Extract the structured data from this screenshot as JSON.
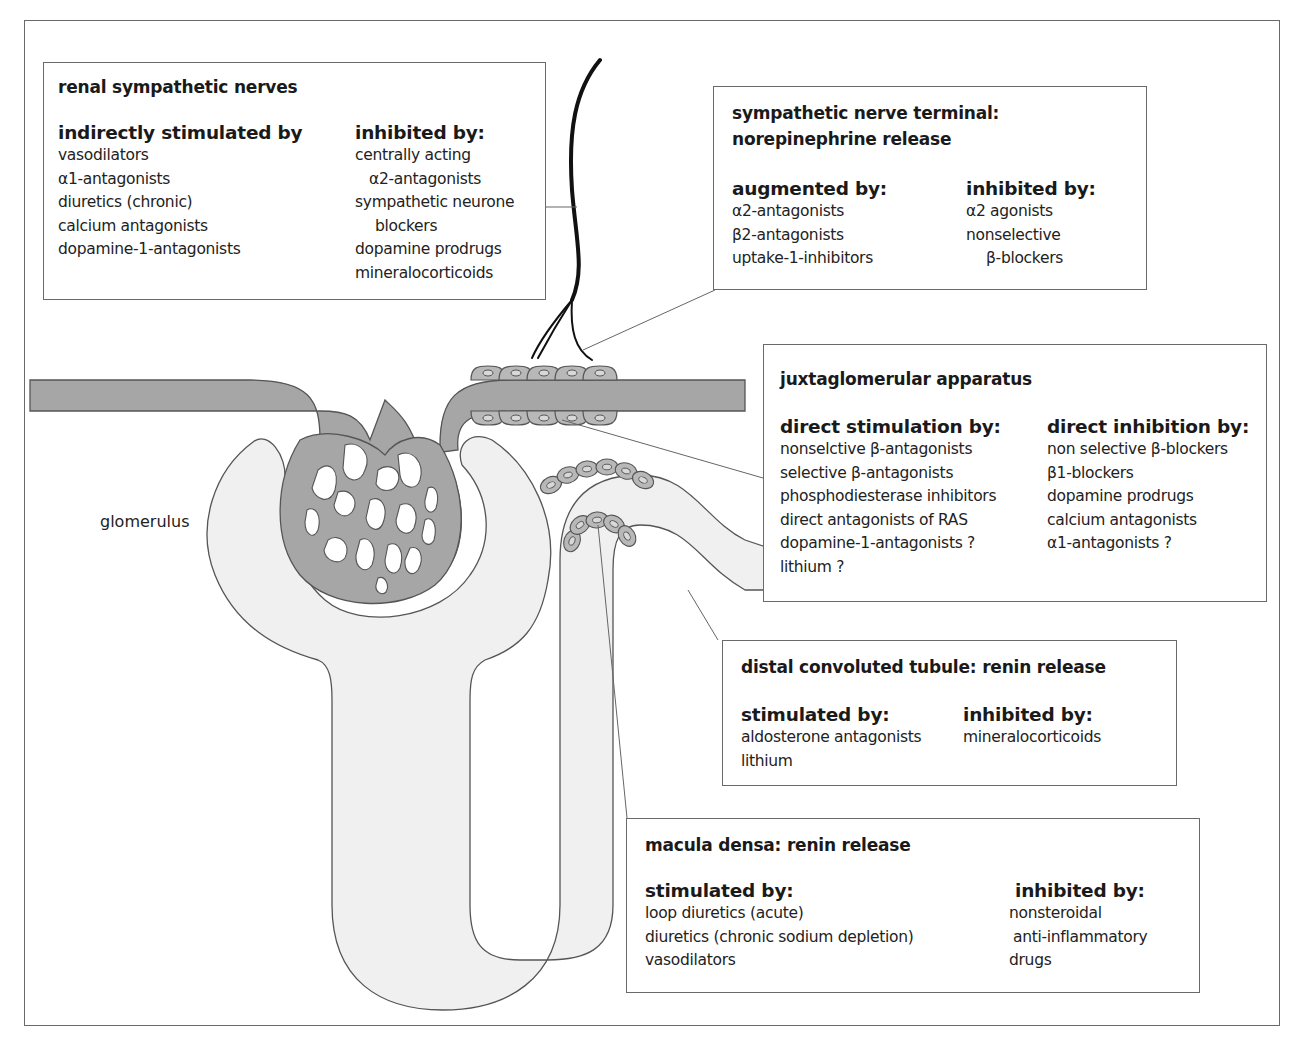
{
  "colors": {
    "vessel": "#a6a6a6",
    "tubule": "#f0f0f0",
    "outline": "#555555",
    "nerve": "#111111"
  },
  "labels": {
    "glomerulus": "glomerulus"
  },
  "boxes": {
    "renal_nerves": {
      "title": "renal sympathetic nerves",
      "left": {
        "heading": "indirectly stimulated by",
        "items": [
          "vasodilators",
          "α1-antagonists",
          "diuretics (chronic)",
          "calcium antagonists",
          "dopamine-1-antagonists"
        ]
      },
      "right": {
        "heading": "inhibited by:",
        "items": [
          "centrally acting",
          "  α2-antagonists",
          "sympathetic neurone",
          "  blockers",
          "dopamine prodrugs",
          "mineralocorticoids"
        ]
      }
    },
    "nerve_terminal": {
      "title_line1": "sympathetic nerve terminal:",
      "title_line2": "norepinephrine release",
      "left": {
        "heading": "augmented by:",
        "items": [
          "α2-antagonists",
          "β2-antagonists",
          "uptake-1-inhibitors"
        ]
      },
      "right": {
        "heading": "inhibited by:",
        "items": [
          "α2 agonists",
          "nonselective",
          "  β-blockers"
        ]
      }
    },
    "juxtaglomerular": {
      "title": "juxtaglomerular apparatus",
      "left": {
        "heading": "direct stimulation by:",
        "items": [
          "nonselctive β-antagonists",
          "selective β-antagonists",
          "phosphodiesterase inhibitors",
          "direct antagonists of RAS",
          "dopamine-1-antagonists ?",
          "lithium ?"
        ]
      },
      "right": {
        "heading": "direct inhibition by:",
        "items": [
          "non selective β-blockers",
          "β1-blockers",
          "dopamine prodrugs",
          "calcium antagonists",
          "α1-antagonists ?"
        ]
      }
    },
    "distal_tubule": {
      "title": "distal convoluted tubule: renin release",
      "left": {
        "heading": "stimulated by:",
        "items": [
          "aldosterone antagonists",
          "lithium"
        ]
      },
      "right": {
        "heading": "inhibited by:",
        "items": [
          "mineralocorticoids"
        ]
      }
    },
    "macula_densa": {
      "title": "macula densa: renin release",
      "left": {
        "heading": "stimulated by:",
        "items": [
          "loop diuretics (acute)",
          "diuretics (chronic sodium depletion)",
          "vasodilators"
        ]
      },
      "right": {
        "heading": "inhibited by:",
        "items": [
          "nonsteroidal",
          " anti-inflammatory",
          "drugs"
        ]
      }
    }
  }
}
